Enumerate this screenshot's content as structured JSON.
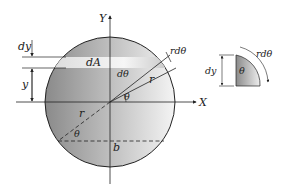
{
  "diagram": {
    "labels": {
      "y_axis": "Y",
      "x_axis": "X",
      "strip_area": "dA",
      "strip_height": "dy",
      "strip_position": "y",
      "radius_upper": "r",
      "radius_lower": "r",
      "arc_length": "rdθ",
      "angle_increment": "dθ",
      "angle_upper": "θ",
      "angle_lower": "θ",
      "chord_width": "b"
    },
    "detail": {
      "height_label": "dy",
      "angle_label": "θ",
      "arc_label": "rdθ"
    },
    "colors": {
      "disk_dark": "#8c8c8c",
      "disk_light": "#f2f2f2",
      "strip": "#e8e8e8",
      "line": "#222222"
    }
  }
}
